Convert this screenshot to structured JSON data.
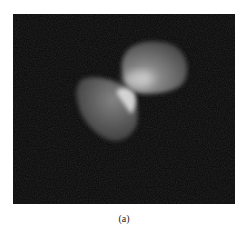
{
  "figure": {
    "caption": "(a)",
    "colors": {
      "background": "#050505",
      "cell_dim": "#5a5a5a",
      "cell_bright": "#d8d8d8"
    }
  }
}
